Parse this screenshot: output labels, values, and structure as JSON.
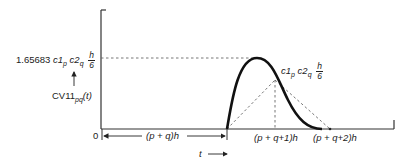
{
  "diagram": {
    "type": "waveform-plot",
    "colors": {
      "axis": "#333333",
      "curve": "#111111",
      "dashed": "#666666"
    },
    "y_axis": {
      "peak_label": {
        "coef": "1.65683",
        "c1": "c1",
        "c1_sub": "p",
        "c2": "c2",
        "c2_sub": "q",
        "frac_num": "h",
        "frac_den": "6"
      },
      "function_label": {
        "name": "CV11",
        "sub": "pq",
        "arg": "(t)"
      },
      "arrow": "up-arrow"
    },
    "x_axis": {
      "origin_label": "0",
      "span_label": "(p + q)h",
      "tick1_label": "(p + q+1)h",
      "tick2_label": "(p + q+2)h",
      "time_label": "t"
    },
    "apex_label": {
      "c1": "c1",
      "c1_sub": "p",
      "c2": "c2",
      "c2_sub": "q",
      "frac_num": "h",
      "frac_den": "6"
    }
  }
}
